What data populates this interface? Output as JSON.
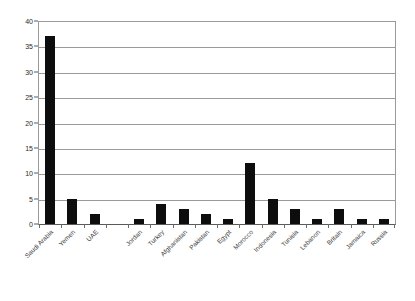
{
  "chart_data": {
    "type": "bar",
    "title": "",
    "subtitle": "",
    "xlabel": "",
    "ylabel": "",
    "ylim": [
      0,
      40
    ],
    "yticks": [
      0,
      5,
      10,
      15,
      20,
      25,
      30,
      35,
      40
    ],
    "ytick_labels": [
      "0",
      "5",
      "10",
      "15",
      "20",
      "25",
      "30",
      "35",
      "40"
    ],
    "grid": true,
    "grid_axis": "y",
    "legend": false,
    "legend_position": "none",
    "bar_color": "#0d0d0d",
    "categories": [
      "Saudi Arabia",
      "Yemen",
      "UAE",
      "",
      "Jordan",
      "Turkey",
      "Afghanistan",
      "Pakistan",
      "Egypt",
      "Morocco",
      "Indonesia",
      "Tunisia",
      "Lebanon",
      "Britain",
      "Jamaica",
      "Russia"
    ],
    "values": [
      37,
      5,
      2,
      0,
      1,
      4,
      3,
      2,
      1,
      12,
      5,
      3,
      1,
      3,
      1,
      1
    ],
    "series": [
      {
        "name": "",
        "values": [
          37,
          5,
          2,
          0,
          1,
          4,
          3,
          2,
          1,
          12,
          5,
          3,
          1,
          3,
          1,
          1
        ]
      }
    ],
    "annotations": []
  }
}
